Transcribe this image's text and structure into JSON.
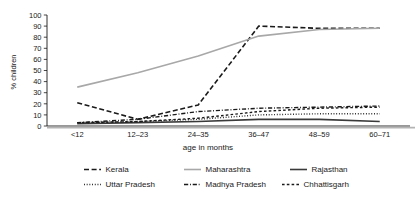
{
  "chart_data": {
    "type": "line",
    "title": "",
    "xlabel": "age in months",
    "ylabel": "% children",
    "categories": [
      "<12",
      "12–23",
      "24–35",
      "36–47",
      "48–59",
      "60–71"
    ],
    "ylim": [
      0,
      100
    ],
    "yticks": [
      0,
      10,
      20,
      30,
      40,
      50,
      60,
      70,
      80,
      90,
      100
    ],
    "grid": false,
    "legend_position": "bottom",
    "series": [
      {
        "name": "Kerala",
        "values": [
          21,
          6,
          19,
          90,
          88,
          88
        ],
        "style": "dashed",
        "color": "#1a1a1a",
        "width": 1.6
      },
      {
        "name": "Maharashtra",
        "values": [
          35,
          48,
          63,
          81,
          87,
          88
        ],
        "style": "solid",
        "color": "#a8a8a8",
        "width": 1.6
      },
      {
        "name": "Rajasthan",
        "values": [
          2,
          3,
          4,
          6,
          6,
          4
        ],
        "style": "solid",
        "color": "#3a3a3a",
        "width": 1.6
      },
      {
        "name": "Uttar Pradesh",
        "values": [
          3,
          4,
          6,
          10,
          11,
          11
        ],
        "style": "dotted",
        "color": "#1a1a1a",
        "width": 1.4
      },
      {
        "name": "Madhya Pradesh",
        "values": [
          3,
          6,
          13,
          16,
          17,
          18
        ],
        "style": "dashdot",
        "color": "#1a1a1a",
        "width": 1.4
      },
      {
        "name": "Chhattisgarh",
        "values": [
          3,
          4,
          7,
          13,
          16,
          17
        ],
        "style": "shortdash",
        "color": "#1a1a1a",
        "width": 1.4
      }
    ]
  },
  "legend": {
    "entries": [
      {
        "label": "Kerala"
      },
      {
        "label": "Maharashtra"
      },
      {
        "label": "Rajasthan"
      },
      {
        "label": "Uttar Pradesh"
      },
      {
        "label": "Madhya Pradesh"
      },
      {
        "label": "Chhattisgarh"
      }
    ]
  }
}
